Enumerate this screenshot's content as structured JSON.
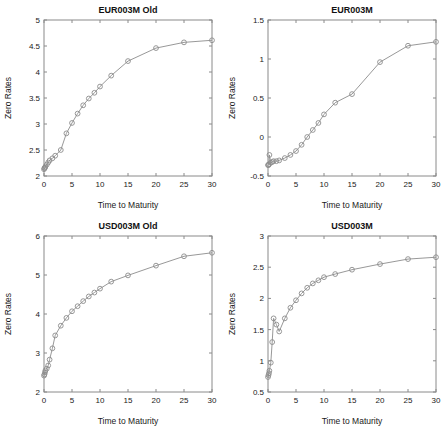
{
  "figure": {
    "background": "#ffffff",
    "line_color": "#8c8c8c",
    "axis_color": "#8a8a8a",
    "text_color": "#1a1a1a",
    "marker": "circle-open"
  },
  "chart_data": [
    {
      "type": "line",
      "title": "EUR003M Old",
      "xlabel": "Time to Maturity",
      "ylabel": "Zero Rates",
      "xlim": [
        0,
        30
      ],
      "ylim": [
        2,
        5
      ],
      "xticks": [
        0,
        5,
        10,
        15,
        20,
        25,
        30
      ],
      "xticklabels": [
        "0",
        "5",
        "10",
        "15",
        "20",
        "25",
        "30"
      ],
      "yticks": [
        2,
        2.5,
        3,
        3.5,
        4,
        4.5,
        5
      ],
      "yticklabels": [
        "2",
        "2.5",
        "3",
        "3.5",
        "4",
        "4.5",
        "5"
      ],
      "grid": false,
      "legend": "none",
      "series": [
        {
          "name": "EUR003M Old",
          "marker": "circle-open",
          "x": [
            0.003,
            0.08,
            0.17,
            0.25,
            0.5,
            0.75,
            1,
            1.5,
            2,
            3,
            4,
            5,
            6,
            7,
            8,
            9,
            10,
            12,
            15,
            20,
            25,
            30
          ],
          "y": [
            2.13,
            2.15,
            2.16,
            2.18,
            2.22,
            2.26,
            2.3,
            2.34,
            2.39,
            2.5,
            2.82,
            3.02,
            3.2,
            3.36,
            3.49,
            3.6,
            3.72,
            3.93,
            4.21,
            4.46,
            4.57,
            4.61
          ]
        }
      ]
    },
    {
      "type": "line",
      "title": "EUR003M",
      "xlabel": "Time to Maturity",
      "ylabel": "Zero Rates",
      "xlim": [
        0,
        30
      ],
      "ylim": [
        -0.5,
        1.5
      ],
      "xticks": [
        0,
        5,
        10,
        15,
        20,
        25,
        30
      ],
      "xticklabels": [
        "0",
        "5",
        "10",
        "15",
        "20",
        "25",
        "30"
      ],
      "yticks": [
        -0.5,
        0,
        0.5,
        1,
        1.5
      ],
      "yticklabels": [
        "-0.5",
        "0",
        "0.5",
        "1",
        "1.5"
      ],
      "grid": false,
      "legend": "none",
      "series": [
        {
          "name": "EUR003M",
          "marker": "circle-open",
          "x": [
            0.003,
            0.08,
            0.17,
            0.25,
            0.5,
            0.75,
            1,
            1.5,
            2,
            3,
            4,
            5,
            6,
            7,
            8,
            9,
            10,
            12,
            15,
            20,
            25,
            30
          ],
          "y": [
            -0.36,
            -0.36,
            -0.35,
            -0.23,
            -0.33,
            -0.32,
            -0.31,
            -0.31,
            -0.3,
            -0.27,
            -0.23,
            -0.18,
            -0.1,
            0.0,
            0.09,
            0.18,
            0.29,
            0.44,
            0.55,
            0.96,
            1.17,
            1.22
          ]
        }
      ]
    },
    {
      "type": "line",
      "title": "USD003M Old",
      "xlabel": "Time to Maturity",
      "ylabel": "Zero Rates",
      "xlim": [
        0,
        30
      ],
      "ylim": [
        2,
        6
      ],
      "xticks": [
        0,
        5,
        10,
        15,
        20,
        25,
        30
      ],
      "xticklabels": [
        "0",
        "5",
        "10",
        "15",
        "20",
        "25",
        "30"
      ],
      "yticks": [
        2,
        3,
        4,
        5,
        6
      ],
      "yticklabels": [
        "2",
        "3",
        "4",
        "5",
        "6"
      ],
      "grid": false,
      "legend": "none",
      "series": [
        {
          "name": "USD003M Old",
          "marker": "circle-open",
          "x": [
            0.003,
            0.08,
            0.17,
            0.25,
            0.5,
            0.75,
            1,
            1.5,
            2,
            3,
            4,
            5,
            6,
            7,
            8,
            9,
            10,
            12,
            15,
            20,
            25,
            30
          ],
          "y": [
            2.42,
            2.45,
            2.5,
            2.55,
            2.6,
            2.68,
            2.83,
            3.12,
            3.45,
            3.7,
            3.9,
            4.07,
            4.2,
            4.33,
            4.45,
            4.55,
            4.65,
            4.83,
            4.99,
            5.24,
            5.48,
            5.57
          ]
        }
      ]
    },
    {
      "type": "line",
      "title": "USD003M",
      "xlabel": "Time to Maturity",
      "ylabel": "Zero Rates",
      "xlim": [
        0,
        30
      ],
      "ylim": [
        0.5,
        3
      ],
      "xticks": [
        0,
        5,
        10,
        15,
        20,
        25,
        30
      ],
      "xticklabels": [
        "0",
        "5",
        "10",
        "15",
        "20",
        "25",
        "30"
      ],
      "yticks": [
        0.5,
        1,
        1.5,
        2,
        2.5,
        3
      ],
      "yticklabels": [
        "0.5",
        "1",
        "1.5",
        "2",
        "2.5",
        "3"
      ],
      "grid": false,
      "legend": "none",
      "series": [
        {
          "name": "USD003M",
          "marker": "circle-open",
          "x": [
            0.003,
            0.08,
            0.17,
            0.25,
            0.5,
            0.75,
            1,
            1.5,
            2,
            3,
            4,
            5,
            6,
            7,
            8,
            9,
            10,
            12,
            15,
            20,
            25,
            30
          ],
          "y": [
            0.74,
            0.77,
            0.8,
            0.84,
            0.97,
            1.3,
            1.68,
            1.58,
            1.47,
            1.68,
            1.85,
            1.97,
            2.08,
            2.17,
            2.24,
            2.29,
            2.34,
            2.39,
            2.46,
            2.55,
            2.63,
            2.66
          ]
        }
      ]
    }
  ]
}
